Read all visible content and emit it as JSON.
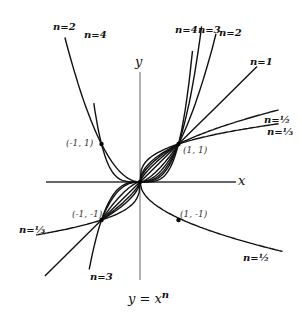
{
  "diagram": {
    "caption": "y = x^n",
    "caption_base": "y = x",
    "caption_exp": "n",
    "axes": {
      "x_label": "x",
      "y_label": "y"
    },
    "points": [
      {
        "label": "(-1, 1)",
        "x": -1,
        "y": 1
      },
      {
        "label": "(1, 1)",
        "x": 1,
        "y": 1
      },
      {
        "label": "(-1, -1)",
        "x": -1,
        "y": -1
      },
      {
        "label": "(1, -1)",
        "x": 1,
        "y": -1
      }
    ],
    "curves": [
      {
        "label": "n=4",
        "n": 4,
        "branches": "even"
      },
      {
        "label": "n=2",
        "n": 2,
        "branches": "even"
      },
      {
        "label": "n=3",
        "n": 3,
        "branches": "odd"
      },
      {
        "label": "n=1",
        "n": 1,
        "branches": "odd"
      },
      {
        "label": "n=1/2",
        "n": 0.5,
        "branches": "plus-minus-sqrt"
      },
      {
        "label": "n=1/3",
        "n": 0.3333,
        "branches": "odd"
      }
    ],
    "curve_labels": {
      "n4_top_left": "n=4",
      "n2_top_left": "n=2",
      "n4_top_right": "n=4",
      "n3_top_right": "n=3",
      "n2_top_right": "n=2",
      "n1": "n=1",
      "n_half_top": "n=½",
      "n_third_right": "n=⅓",
      "n_third_left": "n=⅓",
      "n3_bottom": "n=3",
      "n_half_bottom": "n=½"
    },
    "colors": {
      "curve": "#111111",
      "axis": "#555555",
      "point": "#000000"
    }
  }
}
